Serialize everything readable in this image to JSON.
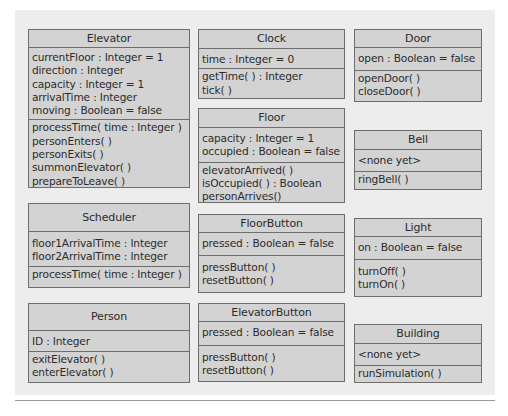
{
  "diagram": {
    "type": "UML class diagram",
    "background_color": "#ededed",
    "box_fill": "#d3d3d3",
    "border_color": "#6e6e6e"
  },
  "classes": {
    "elevator": {
      "name": "Elevator",
      "attributes": [
        "currentFloor : Integer = 1",
        "direction : Integer",
        "capacity : Integer = 1",
        "arrivalTime : Integer",
        "moving : Boolean = false"
      ],
      "operations": [
        "processTime( time : Integer )",
        "personEnters( )",
        "personExits( )",
        "summonElevator( )",
        "prepareToLeave( )"
      ]
    },
    "clock": {
      "name": "Clock",
      "attributes": [
        "time : Integer = 0"
      ],
      "operations": [
        "getTime( ) : Integer",
        "tick( )"
      ]
    },
    "door": {
      "name": "Door",
      "attributes": [
        "open : Boolean = false"
      ],
      "operations": [
        "openDoor( )",
        "closeDoor( )"
      ]
    },
    "floor": {
      "name": "Floor",
      "attributes": [
        "capacity : Integer = 1",
        "occupied : Boolean = false"
      ],
      "operations": [
        "elevatorArrived( )",
        "isOccupied( ) : Boolean",
        "personArrives()"
      ]
    },
    "bell": {
      "name": "Bell",
      "attributes": [
        "<none yet>"
      ],
      "operations": [
        "ringBell( )"
      ]
    },
    "scheduler": {
      "name": "Scheduler",
      "attributes": [
        "floor1ArrivalTime : Integer",
        "floor2ArrivalTime : Integer"
      ],
      "operations": [
        "processTime( time : Integer )"
      ]
    },
    "floorbutton": {
      "name": "FloorButton",
      "attributes": [
        "pressed : Boolean = false"
      ],
      "operations": [
        "pressButton( )",
        "resetButton( )"
      ]
    },
    "light": {
      "name": "Light",
      "attributes": [
        "on : Boolean = false"
      ],
      "operations": [
        "turnOff( )",
        "turnOn( )"
      ]
    },
    "person": {
      "name": "Person",
      "attributes": [
        "ID : Integer"
      ],
      "operations": [
        "exitElevator( )",
        "enterElevator( )"
      ]
    },
    "elevatorbutton": {
      "name": "ElevatorButton",
      "attributes": [
        "pressed : Boolean = false"
      ],
      "operations": [
        "pressButton( )",
        "resetButton( )"
      ]
    },
    "building": {
      "name": "Building",
      "attributes": [
        "<none yet>"
      ],
      "operations": [
        "runSimulation( )"
      ]
    }
  }
}
